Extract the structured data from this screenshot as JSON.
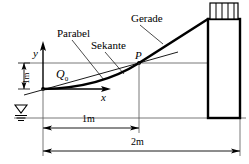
{
  "diagram": {
    "labels": {
      "parabel": "Parabel",
      "sekante": "Sekante",
      "gerade": "Gerade",
      "point_p": "P",
      "axis_y": "y",
      "axis_x": "x",
      "load_q0_symbol": "Q",
      "load_q0_sub": "0",
      "dim_vertical": "1m",
      "dim_span_inner": "1m",
      "dim_span_outer": "2m"
    },
    "colors": {
      "stroke": "#000000",
      "thin": "#3a3a3a",
      "background": "#ffffff",
      "hatch": "#000000"
    },
    "geometry": {
      "origin_x": 43,
      "origin_y": 89,
      "point_p_x": 139,
      "point_p_y": 63,
      "wall_left_x": 208,
      "wall_right_x": 240,
      "wall_top_y": 19,
      "wall_bottom_y": 118,
      "baseline_y": 118,
      "top_level_y": 63,
      "dim_inner_y": 125,
      "dim_outer_y": 148
    }
  }
}
